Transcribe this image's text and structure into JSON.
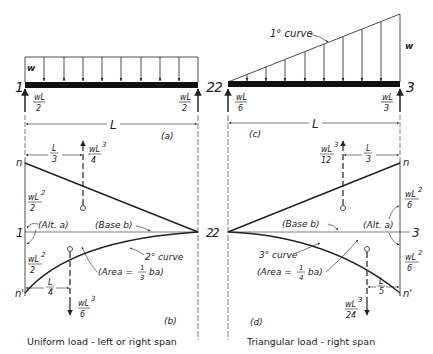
{
  "left_panel": {
    "load_label": "w",
    "node_left": "1",
    "node_right": "2",
    "reaction_left": {
      "num": "wL",
      "den": "2"
    },
    "reaction_right": {
      "num": "wL",
      "den": "2"
    },
    "span_label": "L",
    "load_caption": "(a)",
    "moment": {
      "top_node": "n",
      "bottom_node": "n'",
      "left_node": "1",
      "right_node": "2",
      "upper_ordinate": {
        "num": "wL",
        "sup": "2",
        "den": "2"
      },
      "lower_ordinate": {
        "num": "wL",
        "sup": "2",
        "den": "2"
      },
      "upper_dist": {
        "num": "L",
        "den": "3"
      },
      "lower_dist": {
        "num": "L",
        "den": "4"
      },
      "upper_area": {
        "num": "wL",
        "sup": "3",
        "den": "4"
      },
      "lower_area": {
        "num": "wL",
        "sup": "3",
        "den": "6"
      },
      "alt_label": "(Alt. a)",
      "base_label": "(Base b)",
      "curve_label": "2° curve",
      "area_label_pre": "(Area =",
      "area_frac": {
        "num": "1",
        "den": "3"
      },
      "area_label_post": "ba)",
      "caption": "(b)"
    },
    "title": "Uniform load - left or right span"
  },
  "right_panel": {
    "curve_label_load": "1° curve",
    "load_label": "w",
    "node_left": "2",
    "node_right": "3",
    "reaction_left": {
      "num": "wL",
      "den": "6"
    },
    "reaction_right": {
      "num": "wL",
      "den": "3"
    },
    "span_label": "L",
    "load_caption": "(c)",
    "moment": {
      "top_node": "n",
      "bottom_node": "n'",
      "left_node": "2",
      "right_node": "3",
      "upper_ordinate": {
        "num": "wL",
        "sup": "2",
        "den": "6"
      },
      "lower_ordinate": {
        "num": "wL",
        "sup": "2",
        "den": "6"
      },
      "upper_dist": {
        "num": "L",
        "den": "3"
      },
      "lower_dist": {
        "num": "L",
        "den": "5"
      },
      "upper_area": {
        "num": "wL",
        "sup": "3",
        "den": "12"
      },
      "lower_area": {
        "num": "wL",
        "sup": "3",
        "den": "24"
      },
      "alt_label": "(Alt. a)",
      "base_label": "(Base b)",
      "curve_label": "3° curve",
      "area_label_pre": "(Area =",
      "area_frac": {
        "num": "1",
        "den": "4"
      },
      "area_label_post": "ba)",
      "caption": "(d)"
    },
    "title": "Triangular load - right span"
  },
  "colors": {
    "ink": "#222222",
    "background": "#ffffff"
  }
}
